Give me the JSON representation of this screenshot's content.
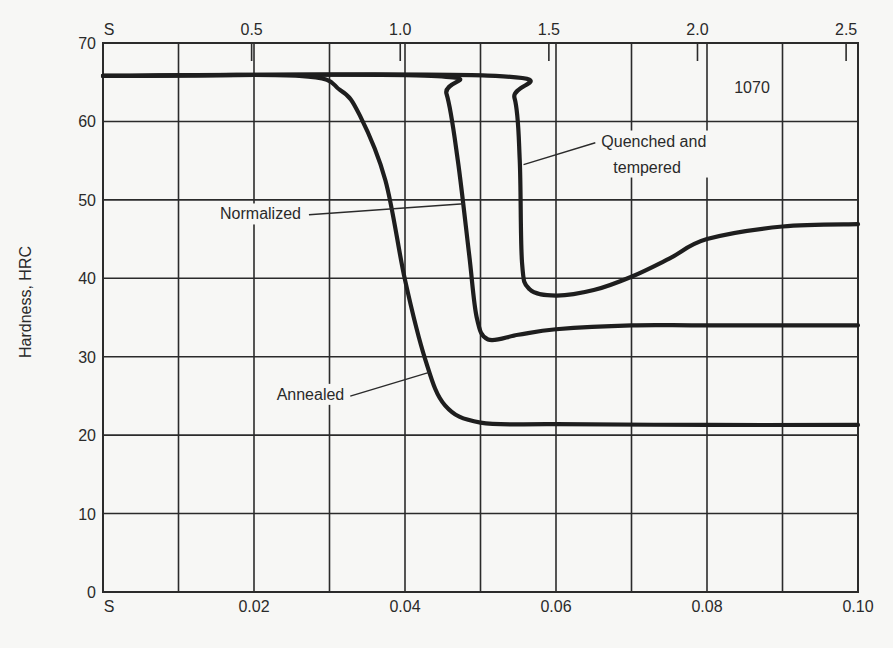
{
  "chart_data": {
    "type": "line",
    "title": "",
    "grade_label": "1070",
    "ylabel": "Hardness, HRC",
    "xlabel_bottom": "",
    "xlabel_top": "",
    "ylim": [
      0,
      70
    ],
    "xlim": [
      0,
      0.1
    ],
    "grid": true,
    "y_ticks": [
      0,
      10,
      20,
      30,
      40,
      50,
      60,
      70
    ],
    "y_tick_labels": [
      "0",
      "10",
      "20",
      "30",
      "40",
      "50",
      "60",
      "70"
    ],
    "x_grid": [
      0,
      0.01,
      0.02,
      0.03,
      0.04,
      0.05,
      0.06,
      0.07,
      0.08,
      0.09,
      0.1
    ],
    "x_bottom_ticks": [
      {
        "value": 0,
        "label": "S"
      },
      {
        "value": 0.02,
        "label": "0.02"
      },
      {
        "value": 0.04,
        "label": "0.04"
      },
      {
        "value": 0.06,
        "label": "0.06"
      },
      {
        "value": 0.08,
        "label": "0.08"
      },
      {
        "value": 0.1,
        "label": "0.10"
      }
    ],
    "x_top_ticks": [
      {
        "value": 0,
        "label": "S"
      },
      {
        "value": 0.5,
        "label": "0.5"
      },
      {
        "value": 1.0,
        "label": "1.0"
      },
      {
        "value": 1.5,
        "label": "1.5"
      },
      {
        "value": 2.0,
        "label": "2.0"
      },
      {
        "value": 2.5,
        "label": "2.5"
      }
    ],
    "top_axis_range": [
      0,
      2.54
    ],
    "series": [
      {
        "name": "Annealed",
        "x": [
          0,
          0.026,
          0.0314,
          0.034,
          0.0374,
          0.04,
          0.0427,
          0.0453,
          0.05,
          0.06,
          0.08,
          0.1
        ],
        "y": [
          65.8,
          65.8,
          64.0,
          60.8,
          52.5,
          39.8,
          29.6,
          23.8,
          21.6,
          21.4,
          21.3,
          21.3
        ]
      },
      {
        "name": "Normalized",
        "x": [
          0,
          0.0435,
          0.0455,
          0.047,
          0.0485,
          0.0495,
          0.051,
          0.055,
          0.06,
          0.07,
          0.08,
          0.1
        ],
        "y": [
          65.8,
          65.8,
          63.5,
          55.0,
          43.0,
          35.0,
          32.2,
          32.8,
          33.5,
          34.0,
          34.0,
          34.0
        ]
      },
      {
        "name": "Quenched and tempered",
        "x": [
          0,
          0.052,
          0.0545,
          0.0552,
          0.0555,
          0.0565,
          0.06,
          0.065,
          0.07,
          0.075,
          0.08,
          0.09,
          0.1
        ],
        "y": [
          65.8,
          65.8,
          63.0,
          55.0,
          42.0,
          38.6,
          37.8,
          38.5,
          40.2,
          42.5,
          45.0,
          46.6,
          46.9
        ]
      }
    ],
    "annotations": [
      {
        "text": "Normalized",
        "x": 0.0155,
        "y": 47.5,
        "leader_to": [
          0.0478,
          49.5
        ]
      },
      {
        "text": "Annealed",
        "x": 0.023,
        "y": 24.5,
        "leader_to": [
          0.0432,
          28.0
        ]
      },
      {
        "text_lines": [
          "Quenched and",
          "tempered"
        ],
        "x": 0.066,
        "y": 56.8,
        "leader_to": [
          0.0557,
          54.5
        ]
      }
    ]
  }
}
